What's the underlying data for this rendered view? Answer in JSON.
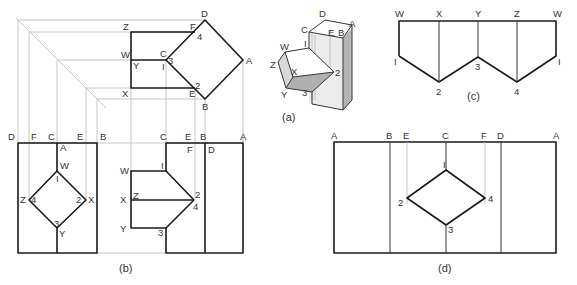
{
  "figure": {
    "captions": {
      "a": "(a)",
      "b": "(b)",
      "c": "(c)",
      "d": "(d)"
    }
  },
  "top_view": {
    "labels": {
      "D": "D",
      "F": "F",
      "Z": "Z",
      "W": "W",
      "C": "C",
      "Y": "Y",
      "one": "I",
      "three": "3",
      "four": "4",
      "A": "A",
      "X": "X",
      "E": "E",
      "two": "2",
      "B": "B"
    }
  },
  "side_view_left": {
    "top_labels": [
      "D",
      "F",
      "C",
      "E",
      "B"
    ],
    "labels": {
      "A": "A",
      "W": "W",
      "one": "I",
      "Z": "Z",
      "four": "4",
      "two": "2",
      "X": "X",
      "three": "3",
      "Y": "Y"
    }
  },
  "front_view": {
    "top_labels": [
      "C",
      "E",
      "B",
      "A"
    ],
    "labels": {
      "F": "F",
      "D": "D",
      "W": "W",
      "one": "I",
      "X": "X",
      "Z": "Z",
      "two": "2",
      "four": "4",
      "Y": "Y",
      "three": "3"
    }
  },
  "isometric": {
    "labels": {
      "D": "D",
      "C": "C",
      "E": "E",
      "B": "B",
      "A": "A",
      "W": "W",
      "one": "I",
      "Z": "Z",
      "X": "X",
      "two": "2",
      "Y": "Y",
      "three": "3"
    }
  },
  "development_c": {
    "top_labels": [
      "W",
      "X",
      "Y",
      "Z",
      "W"
    ],
    "points": [
      "I",
      "2",
      "3",
      "4",
      "I"
    ]
  },
  "development_d": {
    "top_labels": [
      "A",
      "B",
      "E",
      "C",
      "F",
      "D",
      "A"
    ],
    "points": {
      "one": "I",
      "two": "2",
      "three": "3",
      "four": "4"
    }
  }
}
